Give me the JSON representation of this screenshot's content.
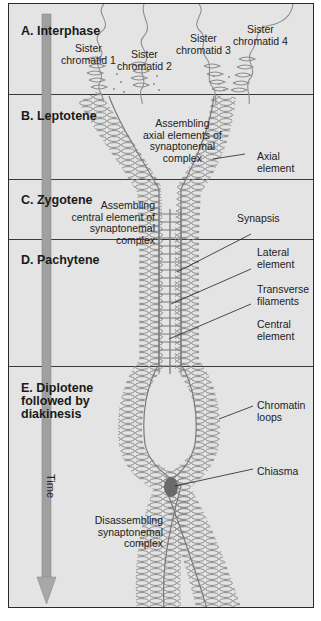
{
  "figure": {
    "colors": {
      "background": "#e4e4e4",
      "border": "#2a2a2a",
      "chromatin": "#8a8a8a",
      "time_arrow": "#9c9c9c",
      "chiasma": "#6a6a6a"
    },
    "time_axis": {
      "label": "Time",
      "direction": "down"
    },
    "stages": [
      {
        "id": "A",
        "title": "A. Interphase"
      },
      {
        "id": "B",
        "title": "B. Leptotene"
      },
      {
        "id": "C",
        "title": "C. Zygotene"
      },
      {
        "id": "D",
        "title": "D. Pachytene"
      },
      {
        "id": "E",
        "title": "E. Diplotene\nfollowed by\ndiakinesis"
      }
    ],
    "labels": {
      "sister_chromatid_1": "Sister\nchromatid 1",
      "sister_chromatid_2": "Sister\nchromatid 2",
      "sister_chromatid_3": "Sister\nchromatid 3",
      "sister_chromatid_4": "Sister\nchromatid 4",
      "assembling_axial": "Assembling\naxial elements of\nsynaptonemal\ncomplex",
      "axial_element": "Axial\nelement",
      "assembling_central": "Assembling\ncentral element of\nsynaptonemal complex",
      "synapsis": "Synapsis",
      "lateral_element": "Lateral\nelement",
      "transverse_filaments": "Transverse\nfilaments",
      "central_element": "Central\nelement",
      "chromatin_loops": "Chromatin\nloops",
      "chiasma": "Chiasma",
      "disassembling": "Disassembling\nsynaptonemal\ncomplex"
    }
  }
}
